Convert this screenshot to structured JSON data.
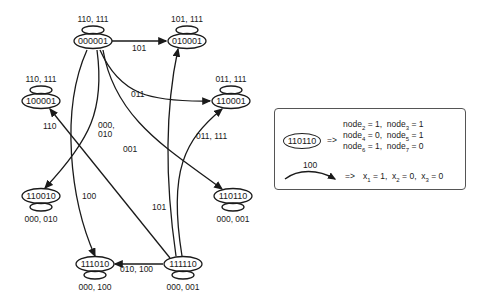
{
  "diagram": {
    "nodes": [
      {
        "id": "000001",
        "x": 93,
        "y": 41,
        "loop": "110, 111",
        "loop_pos": "top"
      },
      {
        "id": "010001",
        "x": 187,
        "y": 41,
        "loop": "101, 111",
        "loop_pos": "top"
      },
      {
        "id": "100001",
        "x": 41,
        "y": 101,
        "loop": "110, 111",
        "loop_pos": "top"
      },
      {
        "id": "110001",
        "x": 231,
        "y": 101,
        "loop": "011, 111",
        "loop_pos": "top"
      },
      {
        "id": "110010",
        "x": 41,
        "y": 196,
        "loop": "000, 010",
        "loop_pos": "bottom"
      },
      {
        "id": "110110",
        "x": 233,
        "y": 196,
        "loop": "000, 001",
        "loop_pos": "bottom"
      },
      {
        "id": "111010",
        "x": 95,
        "y": 264,
        "loop": "000, 100",
        "loop_pos": "bottom"
      },
      {
        "id": "111110",
        "x": 183,
        "y": 264,
        "loop": "000, 001",
        "loop_pos": "bottom"
      }
    ],
    "edges": [
      {
        "from": "000001",
        "to": "010001",
        "label": "101"
      },
      {
        "from": "000001",
        "to": "110001",
        "label": "011"
      },
      {
        "from": "000001",
        "to": "110010",
        "label": "000, 010"
      },
      {
        "from": "000001",
        "to": "110110",
        "label": "001"
      },
      {
        "from": "000001",
        "to": "111010",
        "label": "100"
      },
      {
        "from": "111110",
        "to": "100001",
        "label": "110"
      },
      {
        "from": "111110",
        "to": "010001",
        "label": "101"
      },
      {
        "from": "111110",
        "to": "110001",
        "label": "011, 111"
      },
      {
        "from": "111110",
        "to": "111010",
        "label": "010, 100"
      }
    ]
  },
  "legend": {
    "node_example": "110110",
    "node_arrow": "=>",
    "node_lines": [
      {
        "a_name": "node",
        "a_sub": "2",
        "a_val": "1",
        "b_name": "node",
        "b_sub": "3",
        "b_val": "1"
      },
      {
        "a_name": "node",
        "a_sub": "4",
        "a_val": "0",
        "b_name": "node",
        "b_sub": "5",
        "b_val": "1"
      },
      {
        "a_name": "node",
        "a_sub": "6",
        "a_val": "1",
        "b_name": "node",
        "b_sub": "7",
        "b_val": "0"
      }
    ],
    "edge_example_label": "100",
    "edge_arrow": "=>",
    "edge_line": {
      "x1_name": "x",
      "x1_sub": "1",
      "x1_val": "1",
      "x2_name": "x",
      "x2_sub": "2",
      "x2_val": "0",
      "x3_name": "x",
      "x3_sub": "3",
      "x3_val": "0"
    }
  }
}
